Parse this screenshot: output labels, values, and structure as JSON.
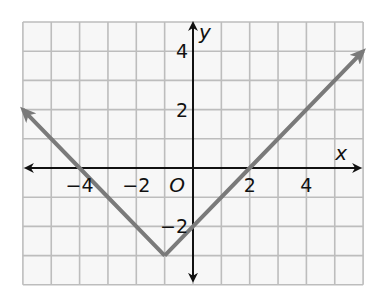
{
  "chart_data": {
    "type": "line",
    "title": "",
    "xlabel": "x",
    "ylabel": "y",
    "origin_label": "O",
    "xlim": [
      -6,
      6
    ],
    "ylim": [
      -4,
      5
    ],
    "grid": true,
    "grid_step": 1,
    "x_tick_labels": [
      {
        "value": -4,
        "label": "−4"
      },
      {
        "value": -2,
        "label": "−2"
      },
      {
        "value": 2,
        "label": "2"
      },
      {
        "value": 4,
        "label": "4"
      }
    ],
    "y_tick_labels": [
      {
        "value": 4,
        "label": "4"
      },
      {
        "value": 2,
        "label": "2"
      },
      {
        "value": -2,
        "label": "−2"
      }
    ],
    "series": [
      {
        "name": "absolute value function",
        "equation_form": "y = |x + 1| - 3",
        "color": "#7a7a7a",
        "points": [
          {
            "x": -6,
            "y": 2
          },
          {
            "x": -4,
            "y": 0
          },
          {
            "x": -1,
            "y": -3
          },
          {
            "x": 0,
            "y": -2
          },
          {
            "x": 2,
            "y": 0
          },
          {
            "x": 6,
            "y": 4
          }
        ],
        "vertex": {
          "x": -1,
          "y": -3
        },
        "arrows_at_ends": true
      }
    ],
    "colors": {
      "grid": "#bdbdbd",
      "axes": "#111111",
      "background": "#f7f7f7"
    }
  }
}
